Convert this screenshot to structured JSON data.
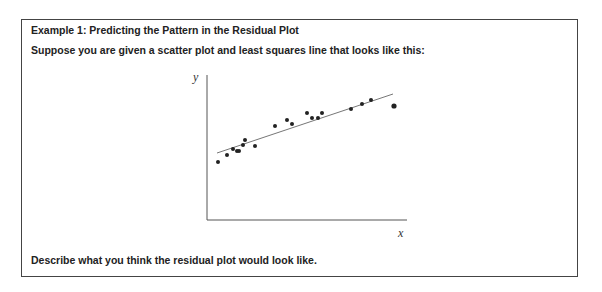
{
  "document": {
    "title": "Example 1:  Predicting the Pattern in the Residual Plot",
    "prompt": "Suppose you are given a scatter plot and least squares line that looks like this:",
    "question": "Describe what you think the residual plot would look like."
  },
  "chart_data": {
    "type": "scatter",
    "title": "",
    "xlabel": "x",
    "ylabel": "y",
    "grid": false,
    "legend": null,
    "axis_ticks": "none",
    "points_pixel": [
      [
        218,
        162
      ],
      [
        227,
        155
      ],
      [
        233,
        149
      ],
      [
        237,
        151
      ],
      [
        239,
        151
      ],
      [
        243,
        145
      ],
      [
        245,
        140
      ],
      [
        255,
        146
      ],
      [
        275,
        126
      ],
      [
        287,
        120
      ],
      [
        292,
        124
      ],
      [
        307,
        113
      ],
      [
        312,
        118
      ],
      [
        318,
        118
      ],
      [
        322,
        113
      ],
      [
        351,
        109
      ],
      [
        362,
        104
      ],
      [
        371,
        100
      ],
      [
        394,
        106
      ]
    ],
    "least_squares_line_pixel": {
      "x1": 217,
      "y1": 153,
      "x2": 393,
      "y2": 94
    },
    "axes_pixel": {
      "origin": [
        207,
        220
      ],
      "y_top": 75,
      "x_right": 407
    }
  }
}
